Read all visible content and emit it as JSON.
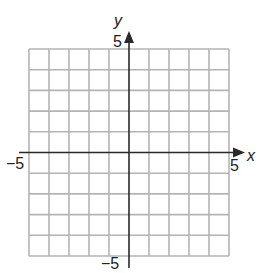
{
  "graph": {
    "type": "coordinate-grid",
    "x_axis": {
      "label": "x",
      "min": -5,
      "max": 5,
      "min_label": "−5",
      "max_label": "5"
    },
    "y_axis": {
      "label": "y",
      "min": -5,
      "max": 5,
      "min_label": "−5",
      "max_label": "5"
    },
    "grid": {
      "columns": 10,
      "rows": 10,
      "line_color": "#b0b0b0",
      "axis_color": "#2a2a2a"
    }
  }
}
